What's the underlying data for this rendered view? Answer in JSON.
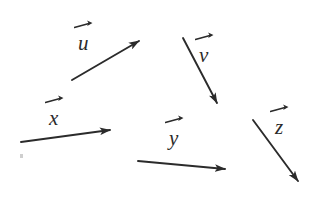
{
  "figure": {
    "background_color": "#ffffff",
    "stroke_color": "#2b2b2b",
    "width": 309,
    "height": 221
  },
  "chart_data": {
    "type": "scatter",
    "title": "",
    "xlabel": "",
    "ylabel": "",
    "grid": false,
    "legend": "none",
    "xlim": [
      0,
      309
    ],
    "ylim": [
      0,
      221
    ],
    "note": "Five free vectors drawn as arrows in an unlabeled plane; coordinates are in pixel space with y increasing downward.",
    "series": [
      {
        "name": "u",
        "label": "u",
        "tail": [
          72,
          80
        ],
        "tip": [
          139,
          41
        ],
        "dx": 67,
        "dy": -39
      },
      {
        "name": "v",
        "label": "v",
        "tail": [
          183,
          38
        ],
        "tip": [
          217,
          103
        ],
        "dx": 34,
        "dy": 65
      },
      {
        "name": "x",
        "label": "x",
        "tail": [
          21,
          142
        ],
        "tip": [
          110,
          130
        ],
        "dx": 89,
        "dy": -12
      },
      {
        "name": "y",
        "label": "y",
        "tail": [
          138,
          161
        ],
        "tip": [
          225,
          169
        ],
        "dx": 87,
        "dy": 8
      },
      {
        "name": "z",
        "label": "z",
        "tail": [
          253,
          120
        ],
        "tip": [
          298,
          181
        ],
        "dx": 45,
        "dy": 61
      }
    ]
  },
  "labels": {
    "u": "u",
    "v": "v",
    "x": "x",
    "y": "y",
    "z": "z"
  }
}
